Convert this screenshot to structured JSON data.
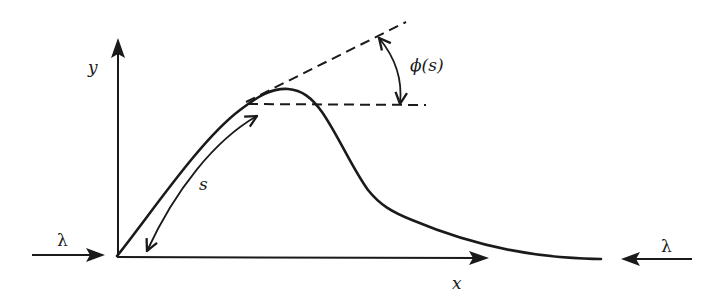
{
  "figure": {
    "type": "elastica-buckling-diagram",
    "colors": {
      "ink": "#1a1a1a",
      "background": "#ffffff"
    },
    "axes": {
      "x_label": "x",
      "y_label": "y",
      "origin": [
        117,
        256
      ]
    },
    "labels": {
      "arc_length": "s",
      "angle": "ϕ(s)",
      "load_left": "λ",
      "load_right": "λ"
    },
    "elements": {
      "curve": "buckled rod profile rising from origin to a peak then decaying toward x-axis",
      "tangent_line": "dashed tangent at a point on the curve",
      "horizontal_reference": "dashed horizontal line through the same point",
      "angle_arc": "double-headed arc between tangent and horizontal indicating ϕ(s)",
      "arc_length_arrow": "double-headed curved arrow along curve from origin indicating s",
      "load_arrows": "compressive load arrows λ pointing inward from both ends"
    }
  }
}
